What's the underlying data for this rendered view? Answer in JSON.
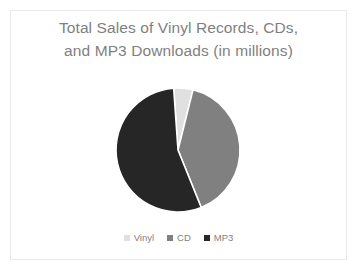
{
  "slide": {
    "background_color": "#ffffff",
    "frame_color": "#eaeaea"
  },
  "chart_data": {
    "type": "pie",
    "title": "Total Sales of Vinyl Records, CDs,\nand MP3 Downloads (in millions)",
    "title_line_1": "Total Sales of Vinyl Records, CDs,",
    "title_line_2": "and MP3 Downloads (in millions)",
    "xlabel": "",
    "ylabel": "",
    "grid": false,
    "legend_position": "bottom",
    "data_labels": false,
    "start_angle_deg": -4,
    "direction": "clockwise",
    "categories": [
      "Vinyl",
      "CD",
      "MP3"
    ],
    "values": [
      5,
      40,
      55
    ],
    "units": "millions",
    "slices": [
      {
        "label": "Vinyl",
        "value": 5,
        "percent": 5,
        "angle_deg": 18,
        "color": "#e0e0e0"
      },
      {
        "label": "CD",
        "value": 40,
        "percent": 40,
        "angle_deg": 144,
        "color": "#808080"
      },
      {
        "label": "MP3",
        "value": 55,
        "percent": 55,
        "angle_deg": 198,
        "color": "#262626"
      }
    ],
    "legend": [
      {
        "label": "Vinyl",
        "color": "#e0e0e0"
      },
      {
        "label": "CD",
        "color": "#808080"
      },
      {
        "label": "MP3",
        "color": "#262626"
      }
    ],
    "geometry": {
      "center_x": 168,
      "center_y": 140,
      "radius": 62,
      "separator_color": "#ffffff",
      "separator_width": 1.6
    },
    "text_color": "#7f7f7f"
  }
}
